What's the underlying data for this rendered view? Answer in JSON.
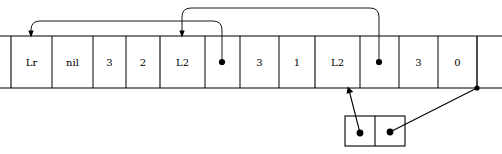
{
  "diagram": {
    "type": "memory-cell-array-with-pointers",
    "canvas": {
      "width": 502,
      "height": 154,
      "background": "#ffffff",
      "ink": "#000000"
    },
    "main_row": {
      "name": "main-cell-array",
      "left": 11,
      "right": 477,
      "top": 36,
      "bottom": 88,
      "rail_left": 0,
      "rail_right": 502,
      "cells": [
        {
          "index": 0,
          "label": "Lr",
          "x0": 11,
          "x1": 52,
          "kind": "text"
        },
        {
          "index": 1,
          "label": "nil",
          "x0": 52,
          "x1": 93,
          "kind": "text"
        },
        {
          "index": 2,
          "label": "3",
          "x0": 93,
          "x1": 126,
          "kind": "text"
        },
        {
          "index": 3,
          "label": "2",
          "x0": 126,
          "x1": 160,
          "kind": "text"
        },
        {
          "index": 4,
          "label": "L2",
          "x0": 160,
          "x1": 205,
          "kind": "text"
        },
        {
          "index": 5,
          "label": "",
          "x0": 205,
          "x1": 240,
          "kind": "pointer"
        },
        {
          "index": 6,
          "label": "3",
          "x0": 240,
          "x1": 279,
          "kind": "text"
        },
        {
          "index": 7,
          "label": "1",
          "x0": 279,
          "x1": 315,
          "kind": "text"
        },
        {
          "index": 8,
          "label": "L2",
          "x0": 315,
          "x1": 360,
          "kind": "text"
        },
        {
          "index": 9,
          "label": "",
          "x0": 360,
          "x1": 399,
          "kind": "pointer"
        },
        {
          "index": 10,
          "label": "3",
          "x0": 399,
          "x1": 438,
          "kind": "text"
        },
        {
          "index": 11,
          "label": "0",
          "x0": 438,
          "x1": 477,
          "kind": "text"
        }
      ]
    },
    "cons_node": {
      "name": "cons-node",
      "left": 345,
      "right": 405,
      "top": 116,
      "bottom": 146,
      "divider_x": 375,
      "cells": [
        {
          "index": 0,
          "label": "",
          "kind": "pointer",
          "dot_x": 360,
          "dot_y": 133
        },
        {
          "index": 1,
          "label": "",
          "kind": "pointer",
          "dot_x": 390,
          "dot_y": 132
        }
      ]
    },
    "pointers": [
      {
        "name": "pointer-cell5-to-cell0",
        "from_cell": 5,
        "to_cell": 0,
        "from_x": 222,
        "to_x": 31,
        "arc_top_y": 21,
        "style": "rounded-arc-up-left"
      },
      {
        "name": "pointer-cell9-to-cell4",
        "from_cell": 9,
        "to_cell": 4,
        "from_x": 379,
        "to_x": 182,
        "arc_top_y": 8,
        "style": "rounded-arc-up-left"
      },
      {
        "name": "pointer-cons-left-to-array",
        "from": "cons-node-cell-0",
        "to_x": 348,
        "to_y": 88,
        "from_x": 360,
        "from_y": 133,
        "style": "straight-diagonal-up-left"
      },
      {
        "name": "pointer-cons-right-to-array-end",
        "from": "cons-node-cell-1",
        "to_x": 477,
        "to_y": 88,
        "from_x": 390,
        "from_y": 132,
        "style": "straight-diagonal-up-right"
      }
    ]
  }
}
